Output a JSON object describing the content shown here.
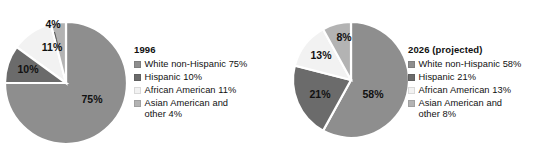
{
  "chart_data": [
    {
      "type": "pie",
      "title": "1996",
      "categories": [
        "White non-Hispanic",
        "Hispanic",
        "African American",
        "Asian American and other"
      ],
      "values": [
        75,
        10,
        11,
        4
      ],
      "value_labels": [
        "75%",
        "10%",
        "11%",
        "4%"
      ],
      "colors": [
        "#8e8e8e",
        "#6b6b6b",
        "#f2f2f2",
        "#b3b3b3"
      ],
      "legend_entries": [
        "White non-Hispanic 75%",
        "Hispanic 10%",
        "African American 11%",
        "Asian American and\nother 4%"
      ],
      "legend_position": "right",
      "start_angle_deg": 0,
      "direction": "clockwise",
      "units": "percent",
      "separator_color": "#ffffff",
      "callout_slice_index": 3
    },
    {
      "type": "pie",
      "title": "2026 (projected)",
      "categories": [
        "White non-Hispanic",
        "Hispanic",
        "African American",
        "Asian American and other"
      ],
      "values": [
        58,
        21,
        13,
        8
      ],
      "value_labels": [
        "58%",
        "21%",
        "13%",
        "8%"
      ],
      "colors": [
        "#8e8e8e",
        "#6b6b6b",
        "#f2f2f2",
        "#b3b3b3"
      ],
      "legend_entries": [
        "White non-Hispanic 58%",
        "Hispanic 21%",
        "African American 13%",
        "Asian American and\nother 8%"
      ],
      "legend_position": "right",
      "start_angle_deg": 0,
      "direction": "clockwise",
      "units": "percent",
      "separator_color": "#ffffff",
      "callout_slice_index": null
    }
  ],
  "chart1": {
    "title": "1996",
    "labels": {
      "s0": "75%",
      "s1": "10%",
      "s2": "11%",
      "s3": "4%"
    },
    "legend": {
      "item0": "White non-Hispanic 75%",
      "item1": "Hispanic 10%",
      "item2": "African American 11%",
      "item3": "Asian American and\nother 4%"
    }
  },
  "chart2": {
    "title": "2026 (projected)",
    "labels": {
      "s0": "58%",
      "s1": "21%",
      "s2": "13%",
      "s3": "8%"
    },
    "legend": {
      "item0": "White non-Hispanic 58%",
      "item1": "Hispanic 21%",
      "item2": "African American 13%",
      "item3": "Asian American and\nother 8%"
    }
  },
  "palette": {
    "white_non_hispanic": "#8e8e8e",
    "hispanic": "#6b6b6b",
    "african_american": "#f2f2f2",
    "asian_american_other": "#b3b3b3",
    "background": "#ffffff",
    "text": "#111111"
  }
}
